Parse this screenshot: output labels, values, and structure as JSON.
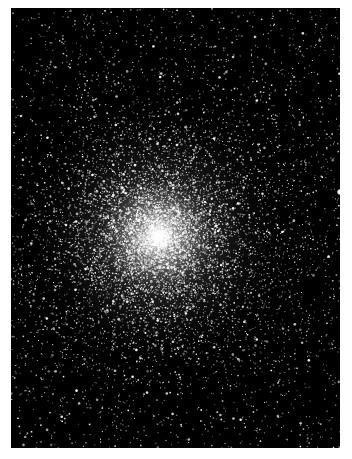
{
  "image": {
    "subject": "globular star cluster",
    "alt": "Dense globular star cluster on black sky",
    "background_color": "#ffffff",
    "sky_color": "#000000",
    "star_color": "#ffffff",
    "frame": {
      "x": 11,
      "y": 8,
      "width": 329,
      "height": 440
    },
    "core": {
      "x": 147,
      "y": 228,
      "glow_radius": 70
    },
    "star_field": {
      "count_dense": 9000,
      "count_background": 2500,
      "core_sigma": 75,
      "seed": 47
    }
  }
}
